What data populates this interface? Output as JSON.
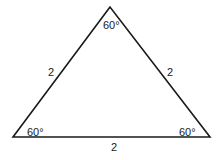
{
  "figure": {
    "shape": "equilateral-triangle",
    "stroke_color": "#1a1a1a",
    "background": "#ffffff",
    "vertices": {
      "top": [
        110,
        7
      ],
      "bottom_left": [
        13,
        137
      ],
      "bottom_right": [
        210,
        137
      ]
    },
    "angles": {
      "top": "60°",
      "bottom_left": "60°",
      "bottom_right": "60°"
    },
    "sides": {
      "left": "2",
      "right": "2",
      "bottom": "2"
    }
  }
}
